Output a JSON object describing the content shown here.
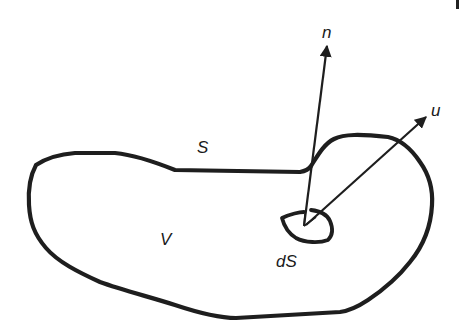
{
  "diagram": {
    "labels": {
      "surface": "S",
      "volume": "V",
      "surface_element": "dS",
      "normal": "n",
      "velocity": "u"
    },
    "colors": {
      "stroke": "#1e1e1e",
      "background": "#ffffff"
    }
  }
}
